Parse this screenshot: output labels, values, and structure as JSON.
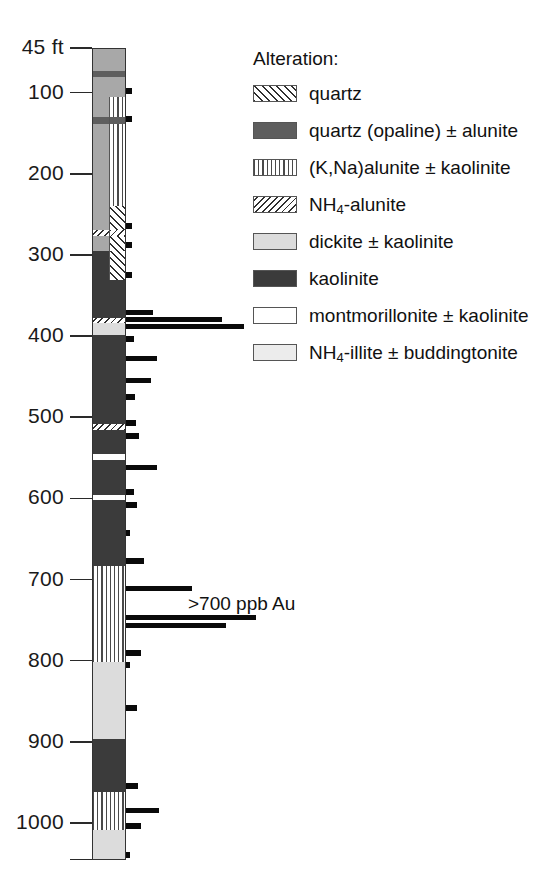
{
  "chart_data": {
    "type": "bar",
    "title": "",
    "xlabel": "Au (ppb)",
    "ylabel": "Depth (ft)",
    "ylim": [
      45,
      1045
    ],
    "grid": false,
    "legend_position": "top-right",
    "axis": {
      "unit_label": "45 ft",
      "top_depth": 45,
      "bottom_depth": 1045,
      "ticks": [
        {
          "label": "45 ft",
          "depth": 45
        },
        {
          "label": "100",
          "depth": 100
        },
        {
          "label": "200",
          "depth": 200
        },
        {
          "label": "300",
          "depth": 300
        },
        {
          "label": "400",
          "depth": 400
        },
        {
          "label": "500",
          "depth": 500
        },
        {
          "label": "600",
          "depth": 600
        },
        {
          "label": "700",
          "depth": 700
        },
        {
          "label": "800",
          "depth": 800
        },
        {
          "label": "900",
          "depth": 900
        },
        {
          "label": "1000",
          "depth": 1000
        }
      ]
    },
    "annotation": ">700 ppb Au",
    "alteration_log": [
      {
        "top": 45,
        "bottom": 72,
        "unit": "montmorillonite",
        "side": "full"
      },
      {
        "top": 72,
        "bottom": 80,
        "unit": "opaline",
        "side": "full"
      },
      {
        "top": 80,
        "bottom": 104,
        "unit": "montmorillonite",
        "side": "full"
      },
      {
        "top": 104,
        "bottom": 129,
        "unit": "montmorillonite",
        "side": "left"
      },
      {
        "top": 104,
        "bottom": 129,
        "unit": "knaalunite",
        "side": "right"
      },
      {
        "top": 129,
        "bottom": 137,
        "unit": "opaline",
        "side": "full"
      },
      {
        "top": 137,
        "bottom": 238,
        "unit": "montmorillonite",
        "side": "left"
      },
      {
        "top": 137,
        "bottom": 238,
        "unit": "knaalunite",
        "side": "right"
      },
      {
        "top": 238,
        "bottom": 268,
        "unit": "montmorillonite",
        "side": "left"
      },
      {
        "top": 238,
        "bottom": 268,
        "unit": "quartz",
        "side": "right"
      },
      {
        "top": 268,
        "bottom": 276,
        "unit": "nh4alunite",
        "side": "full"
      },
      {
        "top": 276,
        "bottom": 294,
        "unit": "montmorillonite",
        "side": "left"
      },
      {
        "top": 276,
        "bottom": 294,
        "unit": "quartz",
        "side": "right"
      },
      {
        "top": 294,
        "bottom": 330,
        "unit": "kaolinite",
        "side": "left"
      },
      {
        "top": 294,
        "bottom": 330,
        "unit": "quartz",
        "side": "right"
      },
      {
        "top": 330,
        "bottom": 376,
        "unit": "kaolinite",
        "side": "full"
      },
      {
        "top": 376,
        "bottom": 383,
        "unit": "nh4alunite",
        "side": "full"
      },
      {
        "top": 383,
        "bottom": 397,
        "unit": "dickite",
        "side": "full"
      },
      {
        "top": 397,
        "bottom": 507,
        "unit": "kaolinite",
        "side": "full"
      },
      {
        "top": 507,
        "bottom": 514,
        "unit": "nh4alunite",
        "side": "full"
      },
      {
        "top": 514,
        "bottom": 544,
        "unit": "kaolinite",
        "side": "full"
      },
      {
        "top": 544,
        "bottom": 551,
        "unit": "white",
        "side": "full"
      },
      {
        "top": 551,
        "bottom": 594,
        "unit": "kaolinite",
        "side": "full"
      },
      {
        "top": 594,
        "bottom": 601,
        "unit": "white",
        "side": "full"
      },
      {
        "top": 601,
        "bottom": 682,
        "unit": "kaolinite",
        "side": "full"
      },
      {
        "top": 682,
        "bottom": 800,
        "unit": "knaalunite",
        "side": "full"
      },
      {
        "top": 800,
        "bottom": 895,
        "unit": "dickite",
        "side": "full"
      },
      {
        "top": 895,
        "bottom": 960,
        "unit": "kaolinite",
        "side": "full"
      },
      {
        "top": 960,
        "bottom": 1008,
        "unit": "knaalunite",
        "side": "full"
      },
      {
        "top": 1008,
        "bottom": 1045,
        "unit": "dickite",
        "side": "full"
      }
    ],
    "gold_bars": [
      {
        "depth": 98,
        "length": 6
      },
      {
        "depth": 133,
        "length": 6
      },
      {
        "depth": 264,
        "length": 6
      },
      {
        "depth": 288,
        "length": 6
      },
      {
        "depth": 325,
        "length": 6
      },
      {
        "depth": 372,
        "length": 27
      },
      {
        "depth": 380,
        "length": 96
      },
      {
        "depth": 389,
        "length": 118
      },
      {
        "depth": 403,
        "length": 8
      },
      {
        "depth": 428,
        "length": 31
      },
      {
        "depth": 455,
        "length": 25
      },
      {
        "depth": 475,
        "length": 9
      },
      {
        "depth": 507,
        "length": 10
      },
      {
        "depth": 523,
        "length": 13
      },
      {
        "depth": 563,
        "length": 31
      },
      {
        "depth": 592,
        "length": 8
      },
      {
        "depth": 608,
        "length": 11
      },
      {
        "depth": 643,
        "length": 4
      },
      {
        "depth": 677,
        "length": 18
      },
      {
        "depth": 712,
        "length": 66
      },
      {
        "depth": 748,
        "length": 130
      },
      {
        "depth": 757,
        "length": 100
      },
      {
        "depth": 790,
        "length": 15
      },
      {
        "depth": 805,
        "length": 4
      },
      {
        "depth": 858,
        "length": 11
      },
      {
        "depth": 954,
        "length": 12
      },
      {
        "depth": 985,
        "length": 33
      },
      {
        "depth": 1004,
        "length": 15
      },
      {
        "depth": 1040,
        "length": 4
      }
    ]
  },
  "legend": {
    "title": "Alteration:",
    "items": [
      {
        "label": "quartz",
        "pattern": "quartz",
        "color": "#ffffff"
      },
      {
        "label": "quartz (opaline) ± alunite",
        "pattern": "opaline",
        "color": "#5e5e5e"
      },
      {
        "label": "(K,Na)alunite ± kaolinite",
        "pattern": "knaalunite",
        "color": "#ffffff"
      },
      {
        "label": "NH4-alunite",
        "pattern": "nh4alunite",
        "color": "#ffffff",
        "rich": {
          "prefix": "NH",
          "sub": "4",
          "suffix": "-alunite"
        }
      },
      {
        "label": "dickite ± kaolinite",
        "pattern": "dickite",
        "color": "#dcdcdc"
      },
      {
        "label": "kaolinite",
        "pattern": "kaolinite",
        "color": "#3b3b3b"
      },
      {
        "label": "montmorillonite ± kaolinite",
        "pattern": "montmor",
        "color": "#a8a8a8"
      },
      {
        "label": "NH4-illite ± buddingtonite",
        "pattern": "illite",
        "color": "#ececec",
        "rich": {
          "prefix": "NH",
          "sub": "4",
          "suffix": "-illite ± buddingtonite"
        }
      }
    ]
  }
}
